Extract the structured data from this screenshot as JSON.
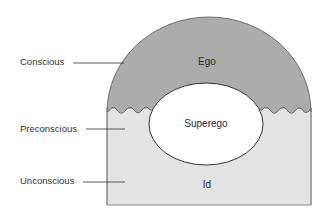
{
  "diagram": {
    "type": "freud-iceberg-model",
    "levels": [
      {
        "label": "Conscious"
      },
      {
        "label": "Preconscious"
      },
      {
        "label": "Unconscious"
      }
    ],
    "structures": {
      "ego": "Ego",
      "superego": "Superego",
      "id": "Id"
    },
    "colors": {
      "conscious_fill": "#acacac",
      "unconscious_fill": "#e3e3e3",
      "superego_fill": "#ffffff",
      "outline": "#555555"
    }
  }
}
